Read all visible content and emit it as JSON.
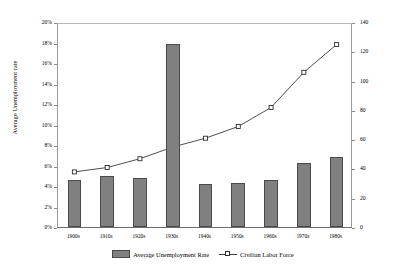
{
  "chart_data": {
    "type": "bar",
    "title": "",
    "subtitle": "",
    "xlabel": "",
    "categories": [
      "1900s",
      "1910s",
      "1920s",
      "1930s",
      "1940s",
      "1950s",
      "1960s",
      "1970s",
      "1980s"
    ],
    "grid": false,
    "legend_position": "bottom",
    "axes": {
      "left": {
        "label": "Average Unemployment rate",
        "ylim": [
          0,
          20
        ],
        "ticks": [
          "0%",
          "2%",
          "4%",
          "6%",
          "8%",
          "10%",
          "12%",
          "14%",
          "16%",
          "18%",
          "20%"
        ],
        "tick_values": [
          0,
          2,
          4,
          6,
          8,
          10,
          12,
          14,
          16,
          18,
          20
        ]
      },
      "right": {
        "label": "Civilian Labor Force (at end of decade) (in millions)",
        "ylim": [
          0,
          140
        ],
        "ticks": [
          "0",
          "20",
          "40",
          "60",
          "80",
          "100",
          "120",
          "140"
        ],
        "tick_values": [
          0,
          20,
          40,
          60,
          80,
          100,
          120,
          140
        ]
      }
    },
    "series": [
      {
        "name": "Average Unemployment Rate",
        "type": "bar",
        "axis": "left",
        "color": "#808080",
        "values": [
          4.6,
          5.0,
          4.8,
          17.9,
          4.2,
          4.3,
          4.6,
          6.2,
          6.8
        ]
      },
      {
        "name": "Civilian Labor Force",
        "type": "line",
        "axis": "right",
        "color": "#3a3a3a",
        "marker": "square",
        "values": [
          39,
          42,
          48,
          56,
          62,
          70,
          83,
          107,
          126
        ]
      }
    ]
  },
  "legend": {
    "items": [
      {
        "label": "Average Unemployment Rate",
        "marker": "bar-swatch"
      },
      {
        "label": "Civilian Labor Force",
        "marker": "line-square-marker"
      }
    ]
  }
}
